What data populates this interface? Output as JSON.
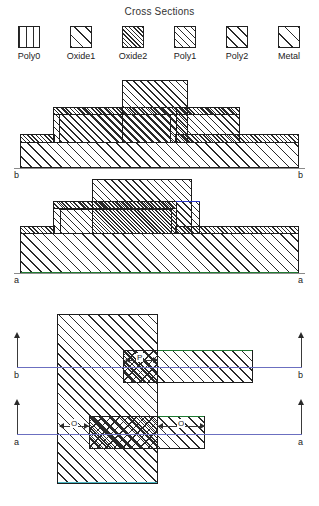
{
  "title": "Cross Sections",
  "legend": {
    "items": [
      {
        "label": "Poly0",
        "pattern": "vertical-lines",
        "icon": "swatch-poly0-icon"
      },
      {
        "label": "Oxide1",
        "pattern": "diagonal-sparse",
        "icon": "swatch-oxide1-icon"
      },
      {
        "label": "Oxide2",
        "pattern": "diagonal-dense",
        "icon": "swatch-oxide2-icon"
      },
      {
        "label": "Poly1",
        "pattern": "diagonal-medium",
        "icon": "swatch-poly1-icon"
      },
      {
        "label": "Poly2",
        "pattern": "diagonal-wide",
        "icon": "swatch-poly2-icon"
      },
      {
        "label": "Metal",
        "pattern": "diagonal-widest",
        "icon": "swatch-metal-icon"
      }
    ]
  },
  "panel_b": {
    "section_label_left": "b",
    "section_label_right": "b",
    "description": "Stepped cross section b-b"
  },
  "panel_a": {
    "section_label_left": "a",
    "section_label_right": "a",
    "description": "Stepped cross section a-a"
  },
  "plan": {
    "section_b_left": "b",
    "section_b_right": "b",
    "section_a_left": "a",
    "section_a_right": "a",
    "dimensions": [
      {
        "name": "dim-p",
        "label": "P"
      },
      {
        "name": "dim-o-left",
        "label": "O"
      },
      {
        "name": "dim-o-right",
        "label": "O"
      }
    ]
  },
  "colors": {
    "outline": "#1d1d1d",
    "hatch": "#2a2a2a",
    "section_line": "#6b6fc0",
    "edge_blue": "#2a36c8",
    "edge_green": "#1f7a32",
    "edge_cyan": "#49b7c4",
    "ground": "#8a8a8a",
    "background": "#ffffff"
  }
}
